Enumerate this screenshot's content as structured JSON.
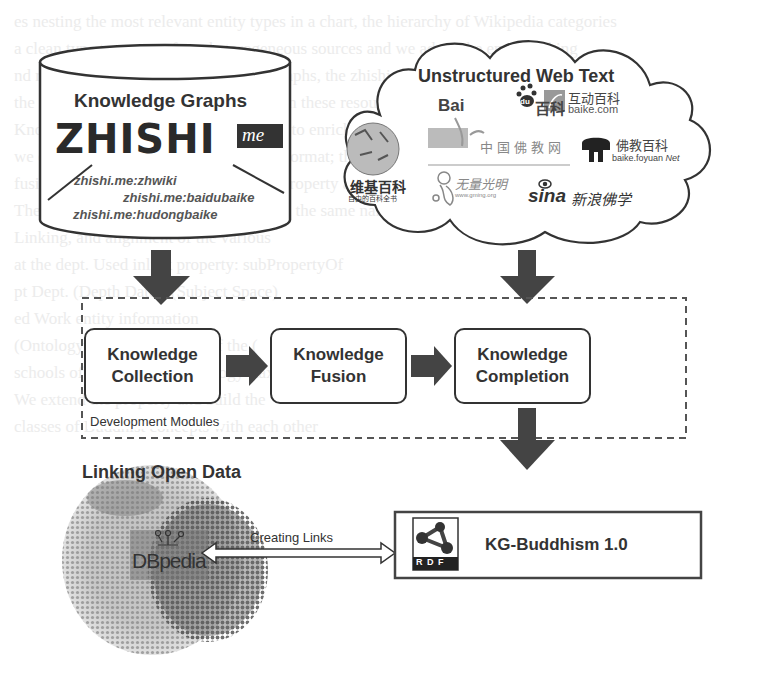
{
  "figure": {
    "knowledge_graphs": {
      "title": "Knowledge Graphs",
      "logo_text": "ZHISHI",
      "logo_suffix": "me",
      "sources": [
        "zhishi.me:zhwiki",
        "zhishi.me:baidubaike",
        "zhishi.me:hudongbaike"
      ]
    },
    "web_text": {
      "title": "Unstructured Web Text",
      "logos": [
        {
          "name": "baidu",
          "text": "Bai",
          "mid": "du",
          "cn": "百科"
        },
        {
          "name": "hudong",
          "cn": "互动百科",
          "sub": "baike.com"
        },
        {
          "name": "wikipedia",
          "cn": "维基百科",
          "sub": "自由的百科全书"
        },
        {
          "name": "fojiao",
          "cn": "中国佛教网"
        },
        {
          "name": "foyuan",
          "cn": "佛教百科",
          "sub": "baike.foyuan",
          "sub2": "Net"
        },
        {
          "name": "guangming",
          "cn": "无量光明",
          "sub": "www.gming.org"
        },
        {
          "name": "sina",
          "text": "sina",
          "cn": "新浪佛学"
        }
      ]
    },
    "modules": {
      "label": "Development Modules",
      "items": [
        {
          "line1": "Knowledge",
          "line2": "Collection"
        },
        {
          "line1": "Knowledge",
          "line2": "Fusion"
        },
        {
          "line1": "Knowledge",
          "line2": "Completion"
        }
      ]
    },
    "lod": {
      "title": "Linking Open Data",
      "dbpedia": "DBpedia"
    },
    "link_label": "Creating Links",
    "output": {
      "rdf_label": "R D F",
      "title": "KG-Buddhism 1.0"
    },
    "colors": {
      "stroke": "#333333",
      "arrow": "#444444",
      "faint_text": "#ececec"
    }
  },
  "background": {
    "faint_lines": [
      "es nesting the most relevant entity types in a chart, the hierarchy of Wikipedia categories",
      "a clean type taxonomy from heterogeneous sources and we adopt the entity linking",
      "nd reuse existing Chinese knowledge graphs, the zhishi.me data in entity types",
      "the facts of each entity are extracted from these resources. For the entity",
      "Knowledge Graphs to Zhishi.me dataset to enrich the knowledge base",
      "we convert the collected data into RDF format; the resulting graph is",
      "fusion, Expert, Buddha's Complete the property and",
      "The Knowledge Fusion maps entity with the same name from different sources",
      "Linking, and alignment of the various",
      "at the dept. Used inlink property: subPropertyOf",
      "pt Dept. (Depth Date), (Subject Space)",
      "ed Work   entity  information",
      "(Ontology) with a hierarchy of the (",
      "schools of Buddhism), a ontology (taxonomy)",
      "We extend the property and build the",
      "classes of Buddhist concepts with each other"
    ]
  }
}
